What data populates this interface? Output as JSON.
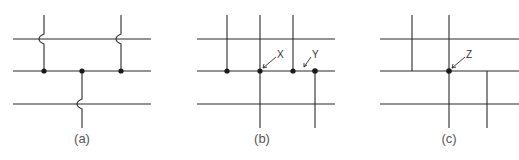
{
  "figure": {
    "panels": [
      {
        "id": "a",
        "caption": "(a)",
        "description": "Crossing wires with hop-overs; junction dots on middle line"
      },
      {
        "id": "b",
        "caption": "(b)",
        "description": "Grid of wires with junction dots",
        "callouts": [
          "X",
          "Y"
        ]
      },
      {
        "id": "c",
        "caption": "(c)",
        "description": "Grid of wires with single junction dot",
        "callouts": [
          "Z"
        ]
      }
    ],
    "colors": {
      "line": "#2a2a2a",
      "dot": "#1a1a1a",
      "caption": "#555555"
    }
  }
}
